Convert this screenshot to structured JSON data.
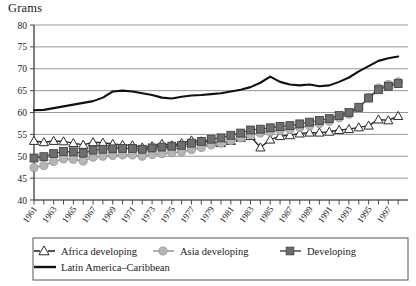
{
  "chart_data": {
    "type": "line",
    "title": "Grams",
    "xlabel": "",
    "ylabel": "Grams",
    "ylim": [
      40,
      80
    ],
    "ytick_step": 5,
    "yticks": [
      40,
      45,
      50,
      55,
      60,
      65,
      70,
      75,
      80
    ],
    "grid": true,
    "grid_axis": "y",
    "legend_position": "bottom",
    "xlim": [
      1961,
      1999
    ],
    "x": [
      1961,
      1962,
      1963,
      1964,
      1965,
      1966,
      1967,
      1968,
      1969,
      1970,
      1971,
      1972,
      1973,
      1974,
      1975,
      1976,
      1977,
      1978,
      1979,
      1980,
      1981,
      1982,
      1983,
      1984,
      1985,
      1986,
      1987,
      1988,
      1989,
      1990,
      1991,
      1992,
      1993,
      1994,
      1995,
      1996,
      1997,
      1998
    ],
    "xtick_labels": [
      "1961",
      "1963",
      "1965",
      "1967",
      "1969",
      "1971",
      "1973",
      "1975",
      "1977",
      "1979",
      "1981",
      "1983",
      "1985",
      "1987",
      "1989",
      "1991",
      "1993",
      "1995",
      "1997"
    ],
    "series": [
      {
        "name": "Africa developing",
        "marker": "triangle-open",
        "color": "#2b2b2b",
        "fill": "#ffffff",
        "values": [
          53.5,
          53.2,
          53.5,
          53.4,
          53.0,
          52.6,
          53.2,
          53.1,
          52.8,
          52.6,
          52.5,
          52.0,
          52.3,
          52.8,
          52.5,
          53.0,
          53.6,
          53.4,
          53.2,
          53.0,
          53.5,
          54.2,
          54.6,
          52.0,
          53.8,
          54.6,
          54.8,
          55.2,
          55.4,
          55.4,
          55.6,
          56.0,
          56.2,
          56.6,
          57.0,
          58.4,
          58.2,
          59.2
        ]
      },
      {
        "name": "Asia developing",
        "marker": "circle",
        "color": "#9a9a9a",
        "fill": "#b5b5b5",
        "values": [
          47.4,
          47.9,
          48.8,
          49.4,
          49.3,
          48.9,
          49.8,
          50.0,
          50.2,
          50.3,
          50.3,
          50.0,
          50.4,
          50.6,
          50.8,
          51.0,
          51.5,
          52.0,
          52.6,
          53.0,
          53.6,
          54.2,
          55.0,
          55.3,
          55.6,
          55.9,
          56.1,
          56.6,
          57.0,
          57.5,
          58.0,
          58.8,
          59.6,
          61.0,
          63.4,
          65.6,
          66.4,
          67.0
        ]
      },
      {
        "name": "Developing",
        "marker": "square",
        "color": "#555555",
        "fill": "#6e6e6e",
        "values": [
          49.6,
          49.9,
          50.6,
          51.1,
          51.0,
          50.7,
          51.4,
          51.6,
          51.7,
          51.8,
          51.8,
          51.6,
          51.9,
          52.1,
          52.3,
          52.5,
          53.0,
          53.4,
          53.9,
          54.2,
          54.8,
          55.3,
          56.0,
          56.2,
          56.5,
          56.8,
          57.0,
          57.4,
          57.8,
          58.2,
          58.6,
          59.3,
          60.0,
          61.2,
          63.3,
          65.2,
          66.0,
          66.6
        ]
      },
      {
        "name": "Latin America–Caribbean",
        "marker": "none",
        "color": "#111111",
        "fill": "none",
        "values": [
          60.5,
          60.6,
          61.0,
          61.4,
          61.8,
          62.2,
          62.6,
          63.4,
          64.8,
          65.0,
          64.8,
          64.4,
          64.0,
          63.4,
          63.2,
          63.6,
          63.9,
          64.0,
          64.2,
          64.4,
          64.8,
          65.2,
          65.8,
          66.8,
          68.2,
          67.0,
          66.4,
          66.2,
          66.4,
          66.0,
          66.2,
          67.0,
          68.0,
          69.4,
          70.6,
          71.8,
          72.4,
          72.8
        ]
      }
    ]
  },
  "legend": {
    "items": [
      {
        "label": "Africa developing",
        "marker": "triangle-open"
      },
      {
        "label": "Asia developing",
        "marker": "circle"
      },
      {
        "label": "Developing",
        "marker": "square"
      },
      {
        "label": "Latin America–Caribbean",
        "marker": "line"
      }
    ]
  }
}
